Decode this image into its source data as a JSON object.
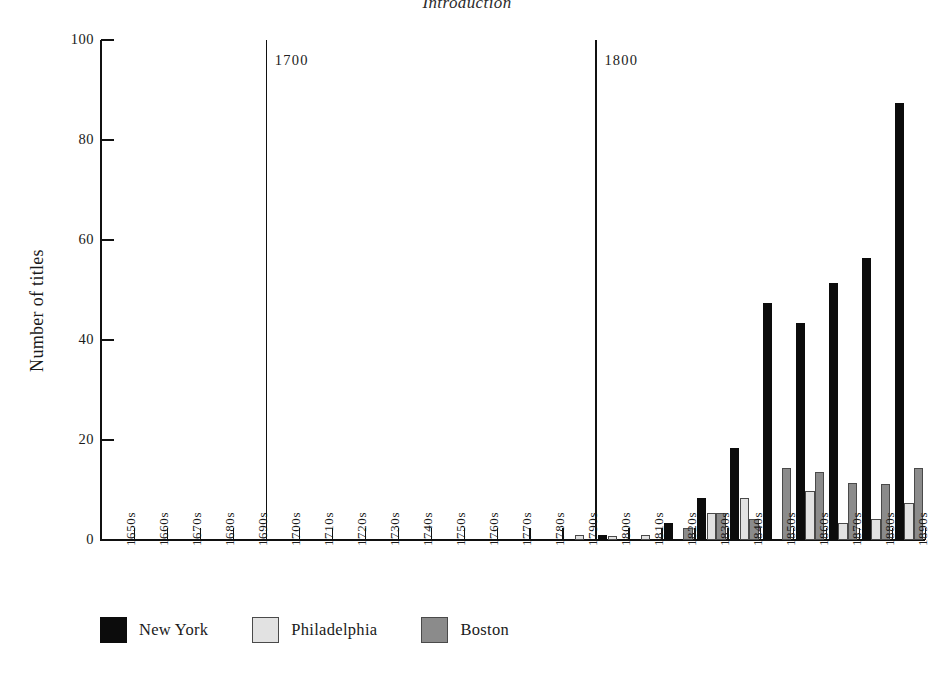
{
  "page": {
    "running_head": "Introduction"
  },
  "chart_data": {
    "type": "bar",
    "title": "",
    "xlabel": "",
    "ylabel": "Number of titles",
    "ylim": [
      0,
      100
    ],
    "yticks": [
      0,
      20,
      40,
      60,
      80,
      100
    ],
    "ytick_labels": [
      "0",
      "20",
      "40",
      "60",
      "80",
      "100"
    ],
    "grid": false,
    "legend_position": "bottom-left",
    "categories": [
      "1650s",
      "1660s",
      "1670s",
      "1680s",
      "1690s",
      "1700s",
      "1710s",
      "1720s",
      "1730s",
      "1740s",
      "1750s",
      "1760s",
      "1770s",
      "1780s",
      "1790s",
      "1800s",
      "1810s",
      "1820s",
      "1830s",
      "1840s",
      "1850s",
      "1860s",
      "1870s",
      "1880s",
      "1890s"
    ],
    "series": [
      {
        "name": "New York",
        "color": "#0c0c0c",
        "values": [
          0,
          0,
          0,
          0,
          0,
          0,
          0,
          0,
          0,
          0,
          0,
          0,
          0,
          0,
          0,
          1,
          0,
          3.5,
          8.5,
          18.5,
          47.5,
          43.5,
          51.5,
          56.5,
          87.5
        ]
      },
      {
        "name": "Philadelphia",
        "color": "#e2e2e2",
        "values": [
          0,
          0,
          0,
          0,
          0,
          0,
          0,
          0,
          0,
          0,
          0,
          0,
          0,
          0,
          1,
          0.8,
          1,
          0,
          5.5,
          8.5,
          0,
          9.8,
          3.5,
          4.2,
          7.5
        ]
      },
      {
        "name": "Boston",
        "color": "#8b8b8b",
        "values": [
          0,
          0,
          0,
          0,
          0,
          0,
          0,
          0,
          0,
          0,
          0,
          0,
          0,
          0,
          0,
          0,
          0,
          2.4,
          5.5,
          4.3,
          14.5,
          13.6,
          11.5,
          11.3,
          14.5
        ]
      }
    ],
    "annotations": [
      {
        "label": "1700",
        "x_category": "1700s",
        "type": "vertical-rule"
      },
      {
        "label": "1800",
        "x_category": "1800s",
        "type": "vertical-rule"
      }
    ]
  }
}
